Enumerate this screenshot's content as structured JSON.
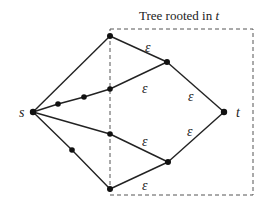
{
  "diagram": {
    "box_title": "Tree rooted in ",
    "box_title_var": "t",
    "edge_label": "ε",
    "nodes": {
      "s": {
        "label": "s",
        "x": 33,
        "y": 112
      },
      "t": {
        "label": "t",
        "x": 224,
        "y": 112
      },
      "top": {
        "x": 110,
        "y": 36
      },
      "upper_right": {
        "x": 167,
        "y": 62
      },
      "mid1": {
        "x": 58,
        "y": 104
      },
      "mid2": {
        "x": 84,
        "y": 97
      },
      "mid3": {
        "x": 110,
        "y": 89
      },
      "low_mid": {
        "x": 110,
        "y": 134
      },
      "low_left": {
        "x": 72,
        "y": 150
      },
      "bottom": {
        "x": 110,
        "y": 189
      },
      "lower_right": {
        "x": 168,
        "y": 162
      }
    },
    "epsilon_labels": [
      {
        "x": 145,
        "y": 47
      },
      {
        "x": 142,
        "y": 88
      },
      {
        "x": 188,
        "y": 96
      },
      {
        "x": 187,
        "y": 131
      },
      {
        "x": 142,
        "y": 142
      },
      {
        "x": 142,
        "y": 186
      }
    ],
    "colors": {
      "line": "#222222",
      "box": "#555555"
    }
  }
}
